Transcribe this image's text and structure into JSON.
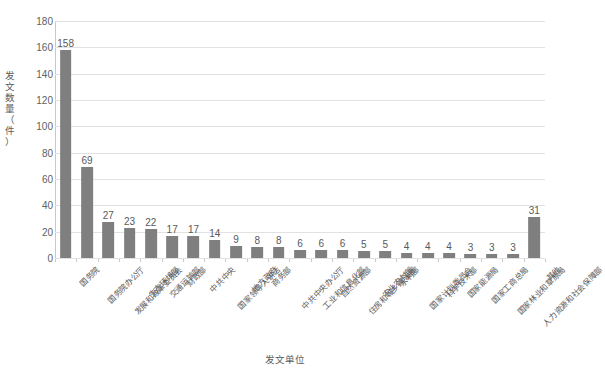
{
  "chart_data": {
    "type": "bar",
    "title": "",
    "xlabel": "发文单位",
    "ylabel": "发文数量（件）",
    "ylim": [
      0,
      180
    ],
    "ytick_step": 20,
    "yticks": [
      0,
      20,
      40,
      60,
      80,
      100,
      120,
      140,
      160,
      180
    ],
    "grid": true,
    "legend": false,
    "bar_color": "#7f7f7f",
    "categories": [
      "国务院",
      "国务院办公厅",
      "发展和改革委员会",
      "生态环境部",
      "交通运输部",
      "财政部",
      "中共中央",
      "国家领导人讲话",
      "地方政府",
      "商务部",
      "中共中央办公厅",
      "工业和信息化部",
      "自然资源部",
      "住房和城乡建设部",
      "农业农村部",
      "水利部",
      "国家计划委员会",
      "科学技术部",
      "国家能源局",
      "国家工商总局",
      "国家林业和草原局",
      "人力资源和社会保障部",
      "其他"
    ],
    "values": [
      158,
      69,
      27,
      23,
      22,
      17,
      17,
      14,
      9,
      8,
      8,
      6,
      6,
      6,
      5,
      5,
      4,
      4,
      4,
      3,
      3,
      3,
      31
    ]
  }
}
